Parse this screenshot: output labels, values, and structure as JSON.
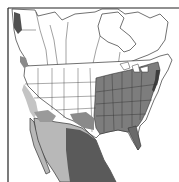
{
  "map": {
    "type": "species-range-map",
    "region": "North America",
    "legend": [],
    "colors": {
      "background": "#ffffff",
      "land": "#ffffff",
      "border": "#333333",
      "range_primary": "#7a7a7a",
      "range_secondary": "#b8b8b8",
      "range_dark": "#555555"
    },
    "areas": [
      {
        "name": "eastern-united-states",
        "shade": "range_primary"
      },
      {
        "name": "southern-mexico-east",
        "shade": "range_dark"
      },
      {
        "name": "western-mexico",
        "shade": "range_secondary"
      },
      {
        "name": "california-central-valley",
        "shade": "range_secondary"
      },
      {
        "name": "pacific-northwest-coast",
        "shade": "range_dark"
      },
      {
        "name": "southwest-desert",
        "shade": "range_secondary"
      },
      {
        "name": "florida",
        "shade": "range_dark"
      }
    ]
  }
}
